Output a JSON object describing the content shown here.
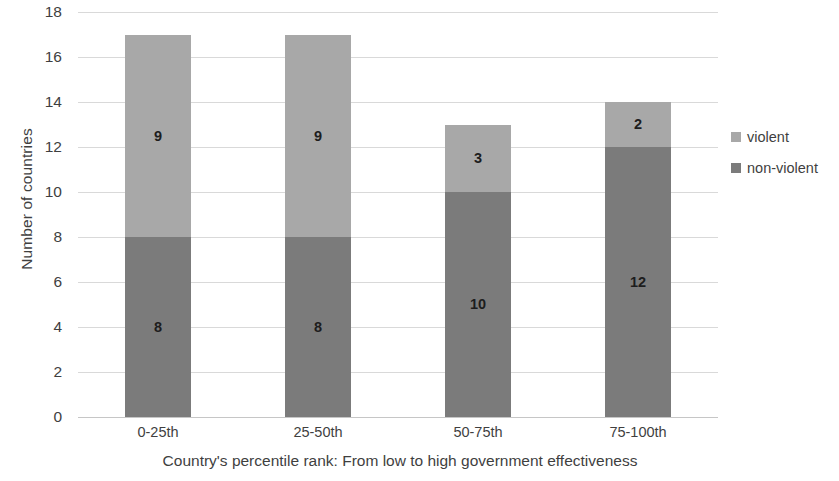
{
  "chart_data": {
    "type": "bar",
    "subtype": "stacked-vertical",
    "title": "",
    "xlabel": "Country's percentile rank: From low to high government effectiveness",
    "ylabel": "Number of countries",
    "categories": [
      "0-25th",
      "25-50th",
      "50-75th",
      "75-100th"
    ],
    "series": [
      {
        "name": "non-violent",
        "values": [
          8,
          8,
          10,
          12
        ],
        "color": "#7b7b7b"
      },
      {
        "name": "violent",
        "values": [
          9,
          9,
          3,
          2
        ],
        "color": "#a8a8a8"
      }
    ],
    "totals": [
      17,
      17,
      13,
      14
    ],
    "ylim": [
      0,
      18
    ],
    "ytick_step": 2,
    "yticks": [
      18,
      16,
      14,
      12,
      10,
      8,
      6,
      4,
      2,
      0
    ],
    "grid": "horizontal",
    "legend_position": "right",
    "legend": [
      "violent",
      "non-violent"
    ],
    "data_labels": true
  },
  "axes": {
    "y_title": "Number of countries",
    "x_title": "Country's percentile rank: From low to high government effectiveness"
  },
  "legend_items": [
    {
      "label": "violent",
      "color": "#a8a8a8"
    },
    {
      "label": "non-violent",
      "color": "#7b7b7b"
    }
  ]
}
